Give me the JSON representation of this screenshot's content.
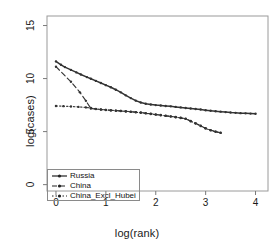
{
  "chart_data": {
    "type": "line",
    "title": "",
    "subtitle": "",
    "xlabel": "log(rank)",
    "ylabel": "log(cases)",
    "xlim": [
      -0.18,
      4.25
    ],
    "ylim": [
      -0.6,
      15.9
    ],
    "xticks": [
      0,
      1,
      2,
      3,
      4
    ],
    "xtick_labels": [
      "0",
      "1",
      "2",
      "3",
      "4"
    ],
    "yticks": [
      0,
      5,
      10,
      15
    ],
    "ytick_labels": [
      "0",
      "5",
      "10",
      "15"
    ],
    "grid": false,
    "legend_position": "bottom-left",
    "series": [
      {
        "name": "Russia",
        "linestyle": "solid",
        "marker": "point",
        "color": "#333333",
        "points": [
          [
            0.0,
            11.62
          ],
          [
            0.1,
            11.3
          ],
          [
            0.18,
            11.08
          ],
          [
            0.3,
            10.82
          ],
          [
            0.41,
            10.58
          ],
          [
            0.5,
            10.38
          ],
          [
            0.62,
            10.14
          ],
          [
            0.7,
            9.98
          ],
          [
            0.8,
            9.78
          ],
          [
            0.9,
            9.58
          ],
          [
            1.0,
            9.38
          ],
          [
            1.1,
            9.18
          ],
          [
            1.2,
            8.95
          ],
          [
            1.3,
            8.7
          ],
          [
            1.4,
            8.42
          ],
          [
            1.5,
            8.16
          ],
          [
            1.6,
            7.92
          ],
          [
            1.7,
            7.74
          ],
          [
            1.8,
            7.62
          ],
          [
            1.9,
            7.56
          ],
          [
            2.0,
            7.5
          ],
          [
            2.1,
            7.46
          ],
          [
            2.2,
            7.42
          ],
          [
            2.3,
            7.38
          ],
          [
            2.4,
            7.33
          ],
          [
            2.5,
            7.28
          ],
          [
            2.6,
            7.23
          ],
          [
            2.7,
            7.18
          ],
          [
            2.8,
            7.13
          ],
          [
            2.9,
            7.08
          ],
          [
            3.0,
            7.02
          ],
          [
            3.1,
            6.97
          ],
          [
            3.2,
            6.92
          ],
          [
            3.3,
            6.88
          ],
          [
            3.4,
            6.84
          ],
          [
            3.5,
            6.8
          ],
          [
            3.6,
            6.77
          ],
          [
            3.7,
            6.74
          ],
          [
            3.8,
            6.72
          ],
          [
            3.9,
            6.7
          ],
          [
            4.0,
            6.68
          ]
        ]
      },
      {
        "name": "China",
        "linestyle": "dashed",
        "marker": "point",
        "color": "#333333",
        "points": [
          [
            0.0,
            11.12
          ],
          [
            0.3,
            9.7
          ],
          [
            0.48,
            8.7
          ],
          [
            0.6,
            7.9
          ],
          [
            0.7,
            7.18
          ],
          [
            0.8,
            7.12
          ],
          [
            0.9,
            7.08
          ],
          [
            1.0,
            7.05
          ],
          [
            1.1,
            7.02
          ],
          [
            1.2,
            6.98
          ],
          [
            1.3,
            6.95
          ],
          [
            1.4,
            6.92
          ],
          [
            1.5,
            6.88
          ],
          [
            1.6,
            6.84
          ],
          [
            1.7,
            6.8
          ],
          [
            1.8,
            6.74
          ],
          [
            1.9,
            6.68
          ],
          [
            2.0,
            6.62
          ],
          [
            2.1,
            6.56
          ],
          [
            2.2,
            6.5
          ],
          [
            2.3,
            6.44
          ],
          [
            2.4,
            6.38
          ],
          [
            2.5,
            6.3
          ],
          [
            2.6,
            6.22
          ],
          [
            2.7,
            6.0
          ],
          [
            2.8,
            5.78
          ],
          [
            2.9,
            5.55
          ],
          [
            3.0,
            5.32
          ],
          [
            3.1,
            5.14
          ],
          [
            3.2,
            5.0
          ],
          [
            3.3,
            4.9
          ]
        ]
      },
      {
        "name": "China_Excl_Hubei",
        "linestyle": "dotted",
        "marker": "point",
        "color": "#333333",
        "points": [
          [
            0.0,
            7.42
          ],
          [
            0.15,
            7.4
          ],
          [
            0.3,
            7.37
          ],
          [
            0.45,
            7.33
          ],
          [
            0.6,
            7.28
          ],
          [
            0.7,
            7.22
          ],
          [
            0.8,
            7.14
          ],
          [
            0.9,
            7.08
          ],
          [
            1.0,
            7.04
          ],
          [
            1.1,
            7.0
          ],
          [
            1.2,
            6.97
          ],
          [
            1.3,
            6.94
          ],
          [
            1.4,
            6.9
          ],
          [
            1.5,
            6.86
          ],
          [
            1.6,
            6.82
          ],
          [
            1.7,
            6.78
          ],
          [
            1.8,
            6.72
          ],
          [
            1.9,
            6.66
          ],
          [
            2.0,
            6.6
          ],
          [
            2.1,
            6.54
          ],
          [
            2.2,
            6.48
          ],
          [
            2.3,
            6.42
          ],
          [
            2.4,
            6.36
          ],
          [
            2.5,
            6.28
          ],
          [
            2.6,
            6.2
          ],
          [
            2.7,
            5.98
          ],
          [
            2.8,
            5.76
          ],
          [
            2.9,
            5.53
          ],
          [
            3.0,
            5.3
          ],
          [
            3.1,
            5.12
          ],
          [
            3.2,
            4.98
          ],
          [
            3.3,
            4.88
          ]
        ]
      }
    ]
  },
  "legend": {
    "items": [
      {
        "label": "Russia",
        "style": "solid"
      },
      {
        "label": "China",
        "style": "dashed"
      },
      {
        "label": "China_Excl_Hubei",
        "style": "dotted"
      }
    ]
  }
}
